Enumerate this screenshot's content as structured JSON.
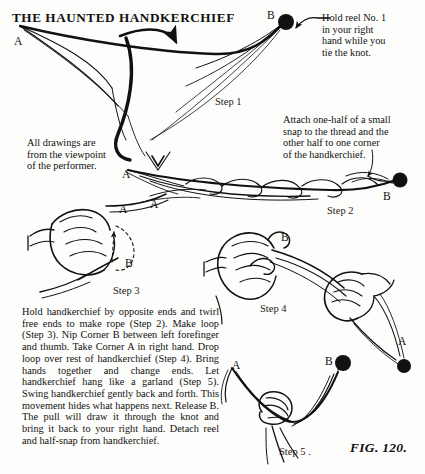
{
  "page": {
    "title": "THE HAUNTED HANDKERCHIEF",
    "figure_caption": "FIG. 120.",
    "background_color": "#fdfdfb",
    "ink_color": "#111111"
  },
  "notes": {
    "reel": "Hold reel No. 1\nin your right\nhand while you\ntie the knot.",
    "snap": "Attach one-half of a small\nsnap to the thread and the\nother half to one corner\nof the handkerchief.",
    "viewpoint": "All drawings are\nfrom the viewpoint\nof the performer."
  },
  "body_text": "Hold handkerchief by opposite ends and twirl free ends to make rope (Step 2). Make loop (Step 3). Nip Corner B between left forefinger and thumb. Take Corner A in right hand. Drop loop over rest of handkerchief (Step 4). Bring hands together and change ends. Let handkerchief hang like a garland (Step 5). Swing handkerchief gently back and forth. This movement hides what happens next. Release B. The pull will draw it through the knot and bring it back to your right hand. Detach reel and half-snap from handkerchief.",
  "step_labels": [
    {
      "name": "step-1",
      "text": "Step 1",
      "x": 215,
      "y": 96
    },
    {
      "name": "step-2",
      "text": "Step 2",
      "x": 327,
      "y": 205
    },
    {
      "name": "step-3",
      "text": "Step 3",
      "x": 113,
      "y": 285
    },
    {
      "name": "step-4",
      "text": "Step 4",
      "x": 260,
      "y": 303
    },
    {
      "name": "step-5",
      "text": "Step 5 .",
      "x": 279,
      "y": 446
    }
  ],
  "corner_labels": [
    {
      "name": "corner-a-step1",
      "text": "A",
      "x": 14,
      "y": 35
    },
    {
      "name": "corner-b-step1",
      "text": "B",
      "x": 267,
      "y": 9
    },
    {
      "name": "corner-a-step2-left",
      "text": "A",
      "x": 122,
      "y": 168
    },
    {
      "name": "corner-a-step2-inner",
      "text": "A",
      "x": 150,
      "y": 198
    },
    {
      "name": "corner-b-step2",
      "text": "B",
      "x": 383,
      "y": 190
    },
    {
      "name": "corner-a-step3",
      "text": "A",
      "x": 119,
      "y": 203
    },
    {
      "name": "corner-b-step3",
      "text": "B",
      "x": 125,
      "y": 257
    },
    {
      "name": "corner-b-step4",
      "text": "B",
      "x": 281,
      "y": 231
    },
    {
      "name": "corner-a-step4",
      "text": "A",
      "x": 398,
      "y": 335
    },
    {
      "name": "corner-a-step5",
      "text": "A",
      "x": 232,
      "y": 359
    },
    {
      "name": "corner-b-step5",
      "text": "B",
      "x": 325,
      "y": 355
    }
  ],
  "reels": [
    {
      "name": "reel-step1",
      "cx": 286,
      "cy": 22,
      "r": 8
    },
    {
      "name": "reel-step2",
      "cx": 400,
      "cy": 180,
      "r": 7.5
    },
    {
      "name": "reel-step4",
      "cx": 404,
      "cy": 366,
      "r": 7
    },
    {
      "name": "reel-step5",
      "cx": 343,
      "cy": 363,
      "r": 8
    },
    {
      "name": "reel-step5-small",
      "cx": 234,
      "cy": 371,
      "r": 0
    }
  ]
}
